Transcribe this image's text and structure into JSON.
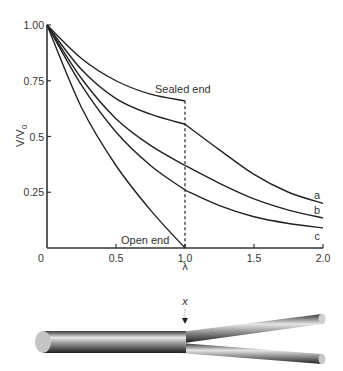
{
  "chart_data": {
    "type": "line",
    "title": "",
    "xlabel": "λ",
    "ylabel": "V/V0",
    "ylabel_main": "V/V",
    "ylabel_sub": "0",
    "xlim": [
      0,
      2.0
    ],
    "ylim": [
      0,
      1.0
    ],
    "grid": false,
    "x_ticks": [
      "0",
      "0.5",
      "1.0",
      "1.5",
      "2.0"
    ],
    "x_tick_values": [
      0,
      0.5,
      1.0,
      1.5,
      2.0
    ],
    "y_ticks": [
      "1.00",
      "0.75",
      "0.5",
      "0.25"
    ],
    "y_tick_values": [
      1.0,
      0.75,
      0.5,
      0.25
    ],
    "series": [
      {
        "name": "Sealed end",
        "x": [
          0,
          0.25,
          0.5,
          0.75,
          1.0
        ],
        "values": [
          1.0,
          0.85,
          0.75,
          0.69,
          0.66
        ]
      },
      {
        "name": "a",
        "x": [
          0,
          0.25,
          0.5,
          0.75,
          1.0,
          1.25,
          1.5,
          1.75,
          2.0
        ],
        "values": [
          1.0,
          0.8,
          0.67,
          0.6,
          0.555,
          0.44,
          0.33,
          0.25,
          0.2
        ]
      },
      {
        "name": "b",
        "x": [
          0,
          0.25,
          0.5,
          0.75,
          1.0,
          1.25,
          1.5,
          1.75,
          2.0
        ],
        "values": [
          1.0,
          0.76,
          0.58,
          0.46,
          0.37,
          0.29,
          0.22,
          0.17,
          0.135
        ]
      },
      {
        "name": "c",
        "x": [
          0,
          0.25,
          0.5,
          0.75,
          1.0,
          1.25,
          1.5,
          1.75,
          2.0
        ],
        "values": [
          1.0,
          0.73,
          0.52,
          0.37,
          0.26,
          0.19,
          0.14,
          0.11,
          0.09
        ]
      },
      {
        "name": "Open end",
        "x": [
          0,
          0.25,
          0.5,
          0.75,
          1.0
        ],
        "values": [
          1.0,
          0.63,
          0.37,
          0.17,
          0.0
        ]
      }
    ],
    "annotations": [
      {
        "text": "Sealed end",
        "x": 1.0,
        "y": 0.66
      },
      {
        "text": "Open end",
        "x": 0.5,
        "y": 0.0
      },
      {
        "text": "a",
        "x": 2.0,
        "y": 0.2
      },
      {
        "text": "b",
        "x": 2.0,
        "y": 0.135
      },
      {
        "text": "c",
        "x": 2.0,
        "y": 0.09
      }
    ],
    "vertical_marker": {
      "x": 1.0,
      "style": "dashed"
    }
  },
  "diagram": {
    "branch_point_label": "x"
  },
  "colors": {
    "line": "#222222",
    "axis": "#333333",
    "text": "#333333"
  }
}
